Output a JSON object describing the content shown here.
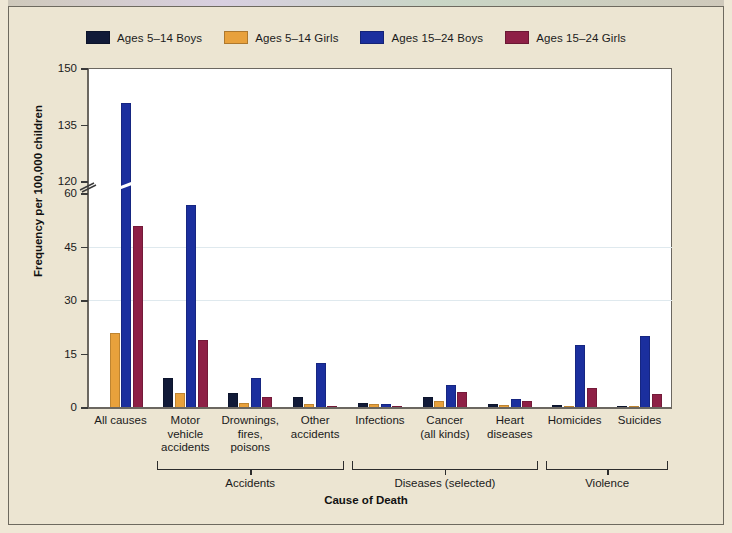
{
  "figure": {
    "background_color": "#ece5d2",
    "plot_background_color": "#ffffff"
  },
  "legend": {
    "position": "top-left",
    "entries": [
      {
        "label": "Ages 5–14 Boys",
        "color": "#111a38",
        "key": "ages_5_14_boys"
      },
      {
        "label": "Ages 5–14 Girls",
        "color": "#e8a13c",
        "key": "ages_5_14_girls"
      },
      {
        "label": "Ages 15–24 Boys",
        "color": "#1b2f9e",
        "key": "ages_15_24_boys"
      },
      {
        "label": "Ages 15–24 Girls",
        "color": "#8e2046",
        "key": "ages_15_24_girls"
      }
    ]
  },
  "chart_data": {
    "type": "bar",
    "title": "",
    "subtitle": "",
    "xlabel": "Cause of Death",
    "ylabel": "Frequency per 100,000 children",
    "grid": false,
    "legend_position": "top-left",
    "axis_break": {
      "present": true,
      "between": [
        60,
        120
      ],
      "symbol": "//"
    },
    "ylim": [
      0,
      150
    ],
    "yticks": [
      0,
      15,
      30,
      45,
      60,
      120,
      135,
      150
    ],
    "ytick_labels": [
      "0",
      "15",
      "30",
      "45",
      "60",
      "120",
      "135",
      "150"
    ],
    "categories": [
      "All causes",
      "Motor vehicle accidents",
      "Drownings, fires, poisons",
      "Other accidents",
      "Infections",
      "Cancer (all kinds)",
      "Heart diseases",
      "Homicides",
      "Suicides"
    ],
    "category_labels": [
      [
        "All causes"
      ],
      [
        "Motor",
        "vehicle",
        "accidents"
      ],
      [
        "Drownings,",
        "fires,",
        "poisons"
      ],
      [
        "Other",
        "accidents"
      ],
      [
        "Infections"
      ],
      [
        "Cancer",
        "(all kinds)"
      ],
      [
        "Heart",
        "diseases"
      ],
      [
        "Homicides"
      ],
      [
        "Suicides"
      ]
    ],
    "series": [
      {
        "name": "Ages 5–14 Boys",
        "color": "#111a38",
        "values": [
          0.0,
          8.3,
          4.2,
          3.1,
          1.5,
          3.0,
          1.0,
          0.8,
          0.5
        ]
      },
      {
        "name": "Ages 5–14 Girls",
        "color": "#e8a13c",
        "values": [
          21.0,
          4.3,
          1.5,
          1.0,
          1.0,
          2.0,
          0.9,
          0.6,
          0.4
        ]
      },
      {
        "name": "Ages 15–24 Boys",
        "color": "#1b2f9e",
        "values": [
          141.0,
          57.0,
          8.5,
          12.5,
          1.1,
          6.5,
          2.6,
          17.6,
          20.3
        ]
      },
      {
        "name": "Ages 15–24 Girls",
        "color": "#8e2046",
        "values": [
          51.0,
          19.0,
          3.0,
          0.6,
          0.5,
          4.6,
          2.1,
          5.5,
          4.0
        ]
      }
    ],
    "groups": [
      {
        "label": "Accidents",
        "categories": [
          "Motor vehicle accidents",
          "Drownings, fires, poisons",
          "Other accidents"
        ]
      },
      {
        "label": "Diseases (selected)",
        "categories": [
          "Infections",
          "Cancer (all kinds)",
          "Heart diseases"
        ]
      },
      {
        "label": "Violence",
        "categories": [
          "Homicides",
          "Suicides"
        ]
      }
    ]
  }
}
